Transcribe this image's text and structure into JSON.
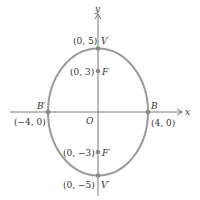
{
  "diagram": {
    "type": "ellipse",
    "axes": {
      "x_label": "x",
      "y_label": "y",
      "origin_label": "O"
    },
    "colors": {
      "ellipse": "#9a9a9a",
      "axis": "#555555",
      "point": "#8a8a8a",
      "text": "#333333"
    },
    "points": {
      "V": {
        "name": "V",
        "coord": "(0, 5)"
      },
      "F": {
        "name": "F",
        "coord": "(0, 3)"
      },
      "B1": {
        "name": "B′",
        "coord": "(−4, 0)"
      },
      "B": {
        "name": "B",
        "coord": "(4, 0)"
      },
      "F1": {
        "name": "F′",
        "coord": "(0, −3)"
      },
      "V1": {
        "name": "V′",
        "coord": "(0, −5)"
      }
    }
  }
}
